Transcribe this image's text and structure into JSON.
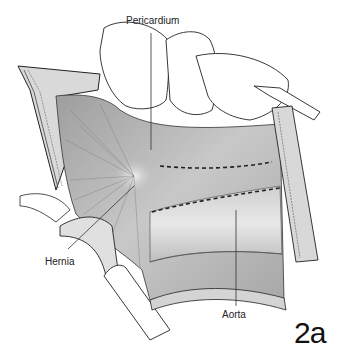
{
  "figure": {
    "id_label": "2a",
    "labels": {
      "pericardium": "Pericardium",
      "hernia": "Hernia",
      "aorta": "Aorta"
    },
    "colors": {
      "background": "#ffffff",
      "tissue_light": "#e6e6e6",
      "tissue_mid": "#bdbdbd",
      "tissue_dark": "#8a8a8a",
      "outline": "#222222"
    }
  }
}
